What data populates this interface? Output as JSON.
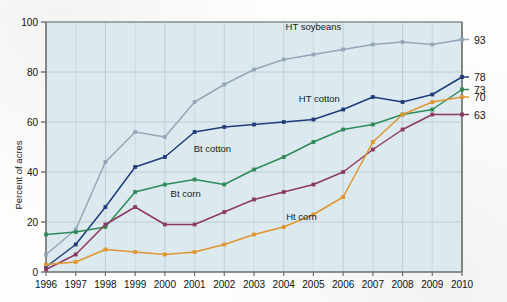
{
  "chart_data": {
    "type": "line",
    "title": "",
    "xlabel": "",
    "ylabel": "Percent of acres",
    "xlim": [
      1996,
      2010
    ],
    "ylim": [
      0,
      100
    ],
    "yticks": [
      0,
      20,
      40,
      60,
      80,
      100
    ],
    "grid": true,
    "legend_position": "inline-annotations",
    "categories": [
      1996,
      1997,
      1998,
      1999,
      2000,
      2001,
      2002,
      2003,
      2004,
      2005,
      2006,
      2007,
      2008,
      2009,
      2010
    ],
    "x_tick_labels": [
      "1996",
      "1997",
      "1998",
      "1999",
      "2000",
      "2001",
      "2002",
      "2003",
      "2004",
      "2005",
      "2006",
      "2007",
      "2008",
      "2009",
      "2010"
    ],
    "y_tick_labels": [
      "0",
      "20",
      "40",
      "60",
      "80",
      "100"
    ],
    "series": [
      {
        "name": "HT soybeans",
        "color": "#94a7b6",
        "label_x": 2005,
        "label_y": 97,
        "end_label": "93",
        "values": [
          7,
          17,
          44,
          56,
          54,
          68,
          75,
          81,
          85,
          87,
          89,
          91,
          92,
          91,
          93
        ]
      },
      {
        "name": "HT cotton",
        "color": "#1f3d7a",
        "label_x": 2005.2,
        "label_y": 68,
        "end_label": "78",
        "values": [
          2,
          11,
          26,
          42,
          46,
          56,
          58,
          59,
          60,
          61,
          65,
          70,
          68,
          71,
          78
        ]
      },
      {
        "name": "Bt cotton",
        "color": "#2e8b57",
        "label_x": 2001.6,
        "label_y": 48,
        "end_label": "73",
        "values": [
          15,
          16,
          18,
          32,
          35,
          37,
          35,
          41,
          46,
          52,
          57,
          59,
          63,
          65,
          73
        ]
      },
      {
        "name": "Bt corn",
        "color": "#8d3a63",
        "label_x": 2000.7,
        "label_y": 30,
        "end_label": "63",
        "values": [
          1,
          7,
          19,
          26,
          19,
          19,
          24,
          29,
          32,
          35,
          40,
          49,
          57,
          63,
          63
        ]
      },
      {
        "name": "Ht corn",
        "color": "#e0962f",
        "label_x": 2004.6,
        "label_y": 21,
        "end_label": "70",
        "values": [
          3,
          4,
          9,
          8,
          7,
          8,
          11,
          15,
          18,
          23,
          30,
          52,
          63,
          68,
          70
        ]
      }
    ],
    "end_labels": [
      "93",
      "78",
      "73",
      "70",
      "63"
    ],
    "colors": {
      "plot_background": "#dce9ef",
      "grid": "#b9c9d2",
      "axis": "#6d6d6d",
      "text": "#111111"
    }
  }
}
